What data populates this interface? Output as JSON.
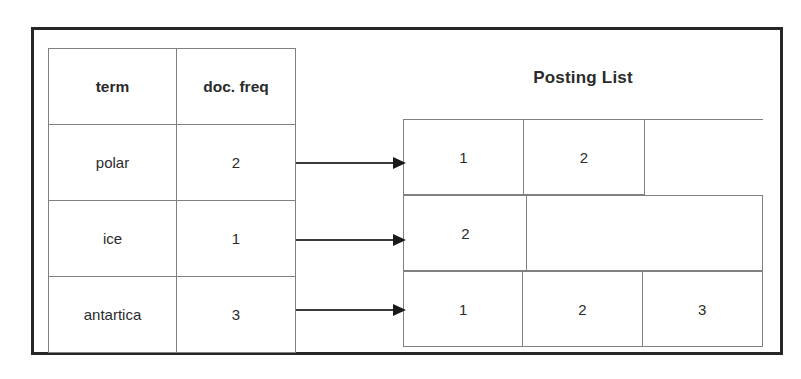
{
  "diagram": {
    "dictionary": {
      "headers": [
        "term",
        "doc. freq"
      ],
      "rows": [
        {
          "term": "polar",
          "doc_freq": "2"
        },
        {
          "term": "ice",
          "doc_freq": "1"
        },
        {
          "term": "antartica",
          "doc_freq": "3"
        }
      ]
    },
    "posting_list": {
      "title": "Posting List",
      "rows": [
        {
          "postings": [
            "1",
            "2"
          ]
        },
        {
          "postings": [
            "2"
          ]
        },
        {
          "postings": [
            "1",
            "2",
            "3"
          ]
        }
      ]
    },
    "connectors": [
      {
        "from": "polar",
        "to": "posting-row-1"
      },
      {
        "from": "ice",
        "to": "posting-row-2"
      },
      {
        "from": "antartica",
        "to": "posting-row-3"
      }
    ],
    "colors": {
      "frame": "#262626",
      "grid": "#808080",
      "text": "#2b2b2b",
      "arrow": "#1a1a1a",
      "background": "#ffffff"
    }
  }
}
